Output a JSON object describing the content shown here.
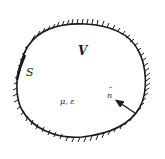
{
  "diagram": {
    "labels": {
      "volume": "V",
      "surface": "S",
      "medium": "μ, ε",
      "normal": "n",
      "normal_hat": "^"
    },
    "elements": [
      {
        "id": "boundary",
        "type": "closed-curve",
        "style": "hatched-outside"
      },
      {
        "id": "normal-vector",
        "type": "arrow",
        "from": "boundary",
        "direction": "inward",
        "label": "n̂"
      }
    ],
    "colors": {
      "ink": "#1a1a1a",
      "background": "#ffffff"
    }
  }
}
